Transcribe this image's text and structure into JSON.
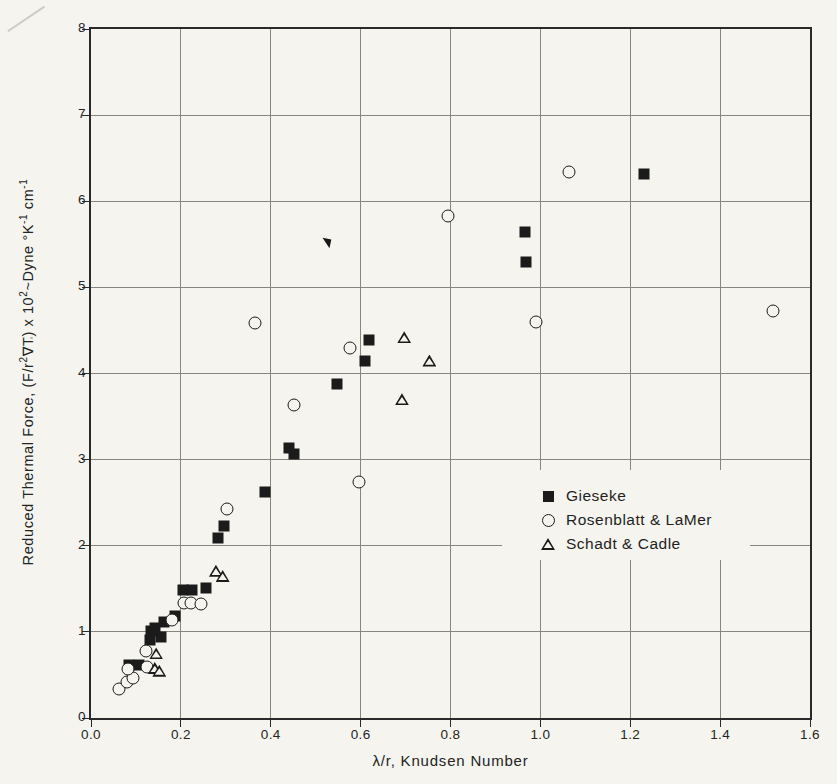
{
  "figure": {
    "paper_color": "#f5f4ee",
    "ink_color": "#1b1b1b",
    "grid_color": "#87857e"
  },
  "chart_data": {
    "type": "scatter",
    "title": "",
    "xlabel": "λ/r, Knudsen Number",
    "ylabel": "Reduced Thermal Force, (F/r²∇T) x 10²~Dyne °K⁻¹ cm⁻¹",
    "ylabel_parts": {
      "t1": "Reduced  Thermal  Force, (F/r",
      "e1": "2",
      "t2": "∇T) x 10",
      "e2": "2",
      "t3": "~Dyne  °K",
      "e3": "-1",
      "t4": " cm",
      "e4": "-1"
    },
    "xlim": [
      0,
      1.6
    ],
    "ylim": [
      0,
      8
    ],
    "x_tick_step": 0.2,
    "y_tick_step": 1,
    "x_ticks": [
      "0.0",
      "0.2",
      "0.4",
      "0.6",
      "0.8",
      "1.0",
      "1.2",
      "1.4",
      "1.6"
    ],
    "y_ticks": [
      "0",
      "1",
      "2",
      "3",
      "4",
      "5",
      "6",
      "7",
      "8"
    ],
    "grid": "on",
    "legend_position": "inside-right-middle",
    "series": [
      {
        "name": "Gieseke",
        "marker": "filled-square",
        "points": [
          [
            0.085,
            0.62
          ],
          [
            0.107,
            0.61
          ],
          [
            0.132,
            0.91
          ],
          [
            0.156,
            0.94
          ],
          [
            0.134,
            1.01
          ],
          [
            0.143,
            1.05
          ],
          [
            0.163,
            1.12
          ],
          [
            0.187,
            1.18
          ],
          [
            0.205,
            1.49
          ],
          [
            0.225,
            1.49
          ],
          [
            0.256,
            1.51
          ],
          [
            0.282,
            2.09
          ],
          [
            0.296,
            2.23
          ],
          [
            0.388,
            2.62
          ],
          [
            0.452,
            3.07
          ],
          [
            0.44,
            3.14
          ],
          [
            0.548,
            3.88
          ],
          [
            0.609,
            4.15
          ],
          [
            0.618,
            4.39
          ],
          [
            0.969,
            5.3
          ],
          [
            0.965,
            5.64
          ],
          [
            1.231,
            6.32
          ]
        ]
      },
      {
        "name": "Rosenblatt & LaMer",
        "marker": "open-circle",
        "points": [
          [
            0.063,
            0.34
          ],
          [
            0.079,
            0.42
          ],
          [
            0.094,
            0.47
          ],
          [
            0.083,
            0.57
          ],
          [
            0.124,
            0.59
          ],
          [
            0.123,
            0.78
          ],
          [
            0.181,
            1.14
          ],
          [
            0.207,
            1.33
          ],
          [
            0.223,
            1.33
          ],
          [
            0.245,
            1.32
          ],
          [
            0.303,
            2.43
          ],
          [
            0.596,
            2.74
          ],
          [
            0.451,
            3.63
          ],
          [
            0.576,
            4.3
          ],
          [
            0.366,
            4.59
          ],
          [
            0.99,
            4.6
          ],
          [
            1.517,
            4.72
          ],
          [
            0.795,
            5.83
          ],
          [
            1.063,
            6.34
          ]
        ]
      },
      {
        "name": "Schadt & Cadle",
        "marker": "open-triangle",
        "points": [
          [
            0.142,
            0.58
          ],
          [
            0.152,
            0.55
          ],
          [
            0.145,
            0.75
          ],
          [
            0.278,
            1.71
          ],
          [
            0.293,
            1.65
          ],
          [
            0.692,
            3.7
          ],
          [
            0.753,
            4.15
          ],
          [
            0.697,
            4.42
          ]
        ]
      }
    ],
    "artifact_mark": {
      "x": 0.524,
      "y": 5.52
    }
  }
}
